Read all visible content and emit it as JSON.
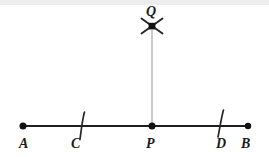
{
  "figure": {
    "canvas": {
      "width": 269,
      "height": 157,
      "background": "#ffffff"
    },
    "colors": {
      "line": "#1f1f1f",
      "point": "#111111",
      "construction_arc": "#262626",
      "perpendicular": "#b5b5b5",
      "label": "#1a1a1a",
      "top_band": "#ededed"
    },
    "baseline": {
      "name": "segment-ab",
      "y": 126,
      "x_start": 22,
      "x_end": 249,
      "stroke_width": 2.2
    },
    "perpendicular": {
      "name": "segment-pq",
      "x": 152,
      "y_top": 30,
      "y_bottom": 126,
      "stroke_width": 1.4
    },
    "points": [
      {
        "id": "A",
        "label": "A",
        "x": 23,
        "y": 126,
        "marker": "dot",
        "radius": 3.4,
        "label_x": 19,
        "label_y": 148
      },
      {
        "id": "C",
        "label": "C",
        "x": 82,
        "y": 126,
        "marker": "tick",
        "radius": 0,
        "label_x": 71,
        "label_y": 148
      },
      {
        "id": "P",
        "label": "P",
        "x": 152,
        "y": 126,
        "marker": "dot",
        "radius": 3.4,
        "label_x": 146,
        "label_y": 148
      },
      {
        "id": "D",
        "label": "D",
        "x": 220,
        "y": 126,
        "marker": "tick",
        "radius": 0,
        "label_x": 216,
        "label_y": 148
      },
      {
        "id": "B",
        "label": "B",
        "x": 248,
        "y": 126,
        "marker": "dot",
        "radius": 3.2,
        "label_x": 241,
        "label_y": 148
      },
      {
        "id": "Q",
        "label": "Q",
        "x": 152,
        "y": 26,
        "marker": "cross-arcs",
        "radius": 0,
        "label_x": 147,
        "label_y": 16
      }
    ],
    "arc_ticks": [
      {
        "id": "tick-c",
        "x_top": 84,
        "y_top": 112,
        "x_bottom": 80,
        "y_bottom": 139,
        "stroke_width": 1.6
      },
      {
        "id": "tick-d",
        "x_top": 223,
        "y_top": 110,
        "x_bottom": 218,
        "y_bottom": 137,
        "stroke_width": 1.6
      }
    ],
    "cross_arcs": {
      "id": "cross-q",
      "center_x": 152,
      "center_y": 26,
      "arm_length": 11,
      "stroke_width": 1.8,
      "hub_size": 6
    }
  }
}
